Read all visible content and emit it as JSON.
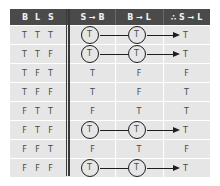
{
  "header": {
    "vars": [
      "B",
      "L",
      "S"
    ],
    "col_sb": "S → B",
    "col_bl": "B → L",
    "col_sl": "∴ S → L"
  },
  "rows": [
    {
      "vars": [
        "T",
        "T",
        "T"
      ],
      "sb": "T",
      "bl": "T",
      "sl": "T",
      "highlight": true
    },
    {
      "vars": [
        "T",
        "T",
        "F"
      ],
      "sb": "T",
      "bl": "T",
      "sl": "T",
      "highlight": true
    },
    {
      "vars": [
        "T",
        "F",
        "T"
      ],
      "sb": "T",
      "bl": "F",
      "sl": "F",
      "highlight": false
    },
    {
      "vars": [
        "T",
        "F",
        "F"
      ],
      "sb": "T",
      "bl": "F",
      "sl": "T",
      "highlight": false
    },
    {
      "vars": [
        "F",
        "T",
        "T"
      ],
      "sb": "F",
      "bl": "T",
      "sl": "T",
      "highlight": false
    },
    {
      "vars": [
        "F",
        "T",
        "F"
      ],
      "sb": "T",
      "bl": "T",
      "sl": "T",
      "highlight": true
    },
    {
      "vars": [
        "F",
        "F",
        "T"
      ],
      "sb": "F",
      "bl": "T",
      "sl": "F",
      "highlight": false
    },
    {
      "vars": [
        "F",
        "F",
        "F"
      ],
      "sb": "T",
      "bl": "T",
      "sl": "T",
      "highlight": true
    }
  ],
  "colors": {
    "header_bg": "#4a4a4a",
    "header_text": "#f0f0f0",
    "row_bg": "#e6e6e6",
    "row_text": "#4a4a4a",
    "circle_stroke": "#1e1e1e"
  }
}
